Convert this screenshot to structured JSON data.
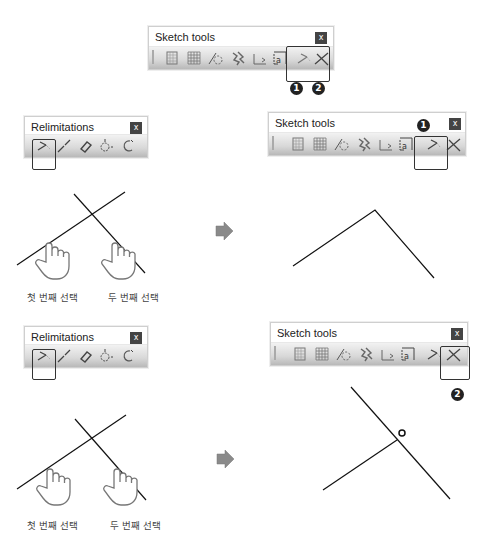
{
  "top_toolbar": {
    "title": "Sketch tools",
    "close_label": "x",
    "icons": [
      "grid-snap-icon",
      "grid-icon",
      "construction-element-icon",
      "geometric-constraint-icon",
      "dimensional-constraint-icon",
      "auto-constraint-icon",
      "trim-icon",
      "break-icon"
    ],
    "badges": [
      "1",
      "2"
    ]
  },
  "section1": {
    "relimitations": {
      "title": "Relimitations",
      "close_label": "x",
      "icons": [
        "trim-icon",
        "break-icon",
        "quick-trim-icon",
        "close-icon",
        "complement-icon"
      ]
    },
    "sketch_tools": {
      "title": "Sketch tools",
      "close_label": "x",
      "badge": "1"
    },
    "captions": {
      "first_select": "첫 번째 선택",
      "second_select": "두 번째 선택"
    }
  },
  "section2": {
    "relimitations": {
      "title": "Relimitations",
      "close_label": "x"
    },
    "sketch_tools": {
      "title": "Sketch tools",
      "close_label": "x",
      "badge": "2"
    },
    "captions": {
      "first_select": "첫 번째 선택",
      "second_select": "두 번째 선택"
    }
  },
  "colors": {
    "close_bg": "#444444",
    "arrow": "#8a8a8a",
    "line": "#111111",
    "highlight": "#333333"
  }
}
